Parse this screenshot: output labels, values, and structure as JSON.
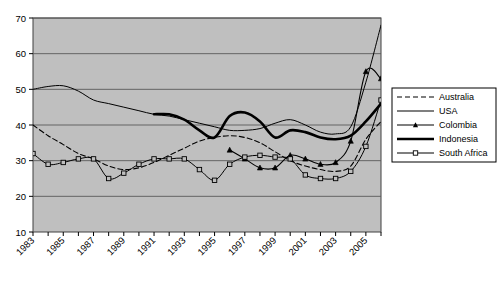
{
  "chart_data": {
    "type": "line",
    "title": "",
    "xlabel": "",
    "ylabel": "",
    "xlim": [
      1983,
      2006
    ],
    "ylim": [
      10,
      70
    ],
    "ytick_values": [
      10,
      20,
      30,
      40,
      50,
      60,
      70
    ],
    "ytick_labels": [
      "10",
      "20",
      "30",
      "40",
      "50",
      "60",
      "70"
    ],
    "xtick_labels": [
      "1983",
      "1985",
      "1987",
      "1989",
      "1991",
      "1993",
      "1995",
      "1997",
      "1999",
      "2001",
      "2003",
      "2005"
    ],
    "xtick_values": [
      1983,
      1985,
      1987,
      1989,
      1991,
      1993,
      1995,
      1997,
      1999,
      2001,
      2003,
      2005
    ],
    "x_minor_every": 1,
    "grid": "horizontal",
    "plot_background": "#bfbfbf",
    "legend_position": "right",
    "series": [
      {
        "name": "Australia",
        "style": "dashed",
        "color": "#000000",
        "x": [
          1983,
          1984,
          1985,
          1986,
          1987,
          1988,
          1989,
          1990,
          1991,
          1992,
          1993,
          1994,
          1995,
          1996,
          1997,
          1998,
          1999,
          2000,
          2001,
          2002,
          2003,
          2004,
          2005,
          2006
        ],
        "values": [
          40.0,
          37.0,
          34.5,
          32.0,
          30.5,
          28.5,
          27.5,
          28.0,
          29.5,
          31.5,
          33.5,
          35.5,
          36.5,
          37.0,
          36.5,
          35.0,
          32.5,
          30.0,
          28.5,
          27.5,
          27.0,
          28.5,
          36.0,
          41.0
        ]
      },
      {
        "name": "USA",
        "style": "thin-solid",
        "color": "#000000",
        "x": [
          1983,
          1984,
          1985,
          1986,
          1987,
          1988,
          1989,
          1990,
          1991,
          1992,
          1993,
          1994,
          1995,
          1996,
          1997,
          1998,
          1999,
          2000,
          2001,
          2002,
          2003,
          2004,
          2005,
          2006
        ],
        "values": [
          50.0,
          50.8,
          51.0,
          49.5,
          47.0,
          46.0,
          45.0,
          44.0,
          43.0,
          42.5,
          41.5,
          40.5,
          39.5,
          38.5,
          38.5,
          39.0,
          40.5,
          41.5,
          40.0,
          38.0,
          37.5,
          39.5,
          52.0,
          68.0
        ]
      },
      {
        "name": "Colombia",
        "style": "solid-triangle",
        "color": "#000000",
        "x": [
          1996,
          1997,
          1998,
          1999,
          2000,
          2001,
          2002,
          2003,
          2004,
          2005,
          2006
        ],
        "values": [
          33.0,
          30.5,
          28.0,
          28.0,
          31.5,
          30.5,
          29.0,
          29.5,
          35.5,
          55.0,
          53.0
        ]
      },
      {
        "name": "Indonesia",
        "style": "thick-solid",
        "color": "#000000",
        "x": [
          1991,
          1992,
          1993,
          1994,
          1995,
          1996,
          1997,
          1998,
          1999,
          2000,
          2001,
          2002,
          2003,
          2004,
          2005,
          2006
        ],
        "values": [
          43.0,
          43.0,
          41.5,
          38.5,
          36.5,
          42.5,
          43.5,
          41.0,
          36.5,
          38.5,
          38.0,
          36.5,
          36.0,
          37.0,
          41.0,
          46.0
        ]
      },
      {
        "name": "South Africa",
        "style": "solid-square",
        "color": "#000000",
        "x": [
          1983,
          1984,
          1985,
          1986,
          1987,
          1988,
          1989,
          1990,
          1991,
          1992,
          1993,
          1994,
          1995,
          1996,
          1997,
          1998,
          1999,
          2000,
          2001,
          2002,
          2003,
          2004,
          2005,
          2006
        ],
        "values": [
          32.0,
          29.0,
          29.5,
          30.5,
          30.5,
          25.0,
          26.5,
          29.0,
          30.5,
          30.5,
          30.5,
          27.5,
          24.5,
          29.0,
          31.0,
          31.5,
          31.0,
          30.5,
          26.0,
          25.0,
          25.0,
          27.0,
          34.0,
          47.0
        ]
      }
    ]
  },
  "legend": {
    "items": [
      {
        "label": "Australia",
        "marker": "none",
        "style": "dashed"
      },
      {
        "label": "USA",
        "marker": "none",
        "style": "thin"
      },
      {
        "label": "Colombia",
        "marker": "triangle",
        "style": "thin"
      },
      {
        "label": "Indonesia",
        "marker": "none",
        "style": "thick"
      },
      {
        "label": "South Africa",
        "marker": "square",
        "style": "thin"
      }
    ]
  }
}
